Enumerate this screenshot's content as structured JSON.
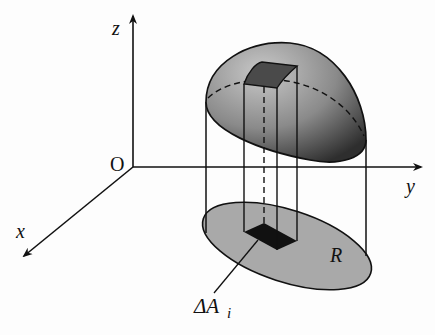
{
  "diagram": {
    "axes": {
      "z_label": "z",
      "y_label": "y",
      "x_label": "x",
      "origin_label": "O"
    },
    "region_label": "R",
    "element_label_main": "ΔA",
    "element_label_sub": "i",
    "colors": {
      "line": "#111111",
      "top_surface_light": "#bdbdbd",
      "top_surface_dark": "#3a3a3a",
      "base_region": "#a8a8a8",
      "column_top": "#555555",
      "area_element": "#111111",
      "background": "#fdfdfd"
    }
  }
}
